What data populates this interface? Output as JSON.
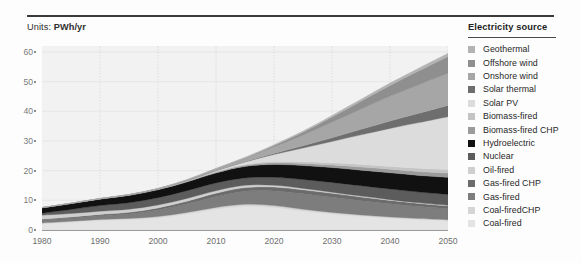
{
  "units": {
    "label": "Units:",
    "value": "PWh/yr"
  },
  "legend": {
    "title": "Electricity source",
    "items": [
      {
        "label": "Geothermal",
        "color": "#b3b3b3"
      },
      {
        "label": "Offshore wind",
        "color": "#8f8f8f"
      },
      {
        "label": "Onshore wind",
        "color": "#a6a6a6"
      },
      {
        "label": "Solar thermal",
        "color": "#6e6e6e"
      },
      {
        "label": "Solar PV",
        "color": "#dcdcdc"
      },
      {
        "label": "Biomass-fired",
        "color": "#c4c4c4"
      },
      {
        "label": "Biomass-fired CHP",
        "color": "#9b9b9b"
      },
      {
        "label": "Hydroelectric",
        "color": "#111111"
      },
      {
        "label": "Nuclear",
        "color": "#5c5c5c"
      },
      {
        "label": "Oil-fired",
        "color": "#cfcfcf"
      },
      {
        "label": "Gas-fired CHP",
        "color": "#6b6b6b"
      },
      {
        "label": "Gas-fired",
        "color": "#7d7d7d"
      },
      {
        "label": "Coal-firedCHP",
        "color": "#d5d5d5"
      },
      {
        "label": "Coal-fired",
        "color": "#e4e4e4"
      }
    ]
  },
  "chart_data": {
    "type": "area",
    "title": "",
    "subtitle": "",
    "xlabel": "",
    "ylabel": "PWh/yr",
    "stacked": true,
    "grid": true,
    "legend_position": "right",
    "xlim": [
      1980,
      2050
    ],
    "ylim": [
      0,
      62
    ],
    "yticks": [
      0,
      10,
      20,
      30,
      40,
      50,
      60
    ],
    "ytick_labels": [
      "0",
      "10",
      "20",
      "30",
      "40",
      "50",
      "60"
    ],
    "xticks": [
      1980,
      1990,
      2000,
      2010,
      2020,
      2030,
      2040,
      2050
    ],
    "xtick_labels": [
      "1980",
      "1990",
      "2000",
      "2010",
      "2020",
      "2030",
      "2040",
      "2050"
    ],
    "x": [
      1980,
      1985,
      1990,
      1995,
      2000,
      2005,
      2010,
      2015,
      2020,
      2025,
      2030,
      2035,
      2040,
      2045,
      2050
    ],
    "series": [
      {
        "name": "Coal-fired",
        "color": "#e4e4e4",
        "values": [
          2.1,
          2.6,
          3.2,
          3.5,
          4.1,
          5.4,
          7.0,
          8.0,
          7.6,
          6.4,
          5.4,
          4.6,
          4.0,
          3.5,
          3.1
        ]
      },
      {
        "name": "Coal-firedCHP",
        "color": "#d5d5d5",
        "values": [
          0.3,
          0.34,
          0.38,
          0.4,
          0.44,
          0.52,
          0.62,
          0.68,
          0.66,
          0.58,
          0.52,
          0.46,
          0.42,
          0.38,
          0.35
        ]
      },
      {
        "name": "Gas-fired",
        "color": "#7d7d7d",
        "values": [
          0.9,
          1.0,
          1.2,
          1.5,
          2.2,
          2.9,
          3.7,
          4.4,
          4.9,
          5.2,
          5.1,
          4.8,
          4.4,
          4.0,
          3.7
        ]
      },
      {
        "name": "Gas-fired CHP",
        "color": "#6b6b6b",
        "values": [
          0.35,
          0.4,
          0.46,
          0.54,
          0.7,
          0.88,
          1.05,
          1.2,
          1.3,
          1.36,
          1.34,
          1.26,
          1.16,
          1.06,
          0.98
        ]
      },
      {
        "name": "Oil-fired",
        "color": "#cfcfcf",
        "values": [
          1.35,
          1.2,
          1.1,
          1.05,
          1.0,
          0.95,
          0.88,
          0.78,
          0.62,
          0.48,
          0.38,
          0.3,
          0.24,
          0.2,
          0.17
        ]
      },
      {
        "name": "Nuclear",
        "color": "#5c5c5c",
        "values": [
          0.7,
          1.4,
          1.9,
          2.2,
          2.45,
          2.6,
          2.6,
          2.5,
          2.7,
          3.0,
          3.3,
          3.5,
          3.6,
          3.65,
          3.7
        ]
      },
      {
        "name": "Hydroelectric",
        "color": "#111111",
        "values": [
          1.75,
          1.95,
          2.15,
          2.45,
          2.65,
          2.95,
          3.35,
          3.85,
          4.3,
          4.7,
          5.0,
          5.25,
          5.45,
          5.6,
          5.75
        ]
      },
      {
        "name": "Biomass-fired CHP",
        "color": "#9b9b9b",
        "values": [
          0.05,
          0.07,
          0.1,
          0.13,
          0.17,
          0.22,
          0.3,
          0.4,
          0.55,
          0.72,
          0.9,
          1.05,
          1.2,
          1.32,
          1.45
        ]
      },
      {
        "name": "Biomass-fired",
        "color": "#c4c4c4",
        "values": [
          0.04,
          0.05,
          0.07,
          0.09,
          0.12,
          0.16,
          0.22,
          0.3,
          0.42,
          0.56,
          0.7,
          0.84,
          0.96,
          1.08,
          1.18
        ]
      },
      {
        "name": "Solar PV",
        "color": "#dcdcdc",
        "values": [
          0.0,
          0.0,
          0.0,
          0.01,
          0.02,
          0.05,
          0.25,
          0.8,
          2.4,
          4.6,
          7.2,
          10.0,
          12.8,
          15.4,
          17.8
        ]
      },
      {
        "name": "Solar thermal",
        "color": "#6e6e6e",
        "values": [
          0.0,
          0.0,
          0.0,
          0.0,
          0.01,
          0.02,
          0.05,
          0.12,
          0.35,
          0.75,
          1.25,
          1.85,
          2.5,
          3.15,
          3.8
        ]
      },
      {
        "name": "Onshore wind",
        "color": "#a6a6a6",
        "values": [
          0.0,
          0.0,
          0.01,
          0.03,
          0.08,
          0.2,
          0.55,
          1.1,
          2.2,
          3.6,
          5.2,
          6.8,
          8.3,
          9.6,
          10.8
        ]
      },
      {
        "name": "Offshore wind",
        "color": "#8f8f8f",
        "values": [
          0.0,
          0.0,
          0.0,
          0.0,
          0.0,
          0.01,
          0.04,
          0.14,
          0.45,
          1.0,
          1.8,
          2.7,
          3.7,
          4.7,
          5.7
        ]
      },
      {
        "name": "Geothermal",
        "color": "#b3b3b3",
        "values": [
          0.05,
          0.06,
          0.08,
          0.1,
          0.12,
          0.15,
          0.18,
          0.22,
          0.3,
          0.4,
          0.52,
          0.64,
          0.78,
          0.92,
          1.05
        ]
      }
    ],
    "totals": [
      7.6,
      9.1,
      10.7,
      12.0,
      14.1,
      17.0,
      20.8,
      24.6,
      28.8,
      33.4,
      38.6,
      44.0,
      49.5,
      54.6,
      59.5
    ]
  }
}
